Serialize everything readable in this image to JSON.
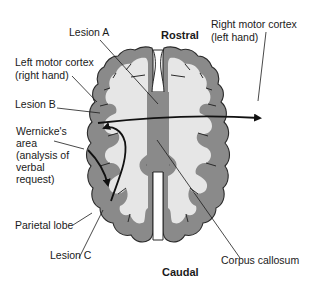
{
  "diagram": {
    "orientation": {
      "top": "Rostral",
      "bottom": "Caudal"
    },
    "labels": {
      "lesion_a": "Lesion A",
      "lesion_b": "Lesion B",
      "lesion_c": "Lesion C",
      "left_motor_line1": "Left motor cortex",
      "left_motor_line2": "(right hand)",
      "right_motor_line1": "Right motor cortex",
      "right_motor_line2": "(left hand)",
      "wernicke_line1": "Wernicke's",
      "wernicke_line2": "area",
      "wernicke_line3": "(analysis of",
      "wernicke_line4": "verbal",
      "wernicke_line5": "request)",
      "parietal": "Parietal lobe",
      "corpus": "Corpus callosum"
    },
    "colors": {
      "gray_matter": "#8a8a8a",
      "white_matter": "#e6e6e6",
      "corpus_callosum": "#8a8a8a",
      "arrow": "#111111",
      "outline": "#2a2a2a"
    }
  }
}
